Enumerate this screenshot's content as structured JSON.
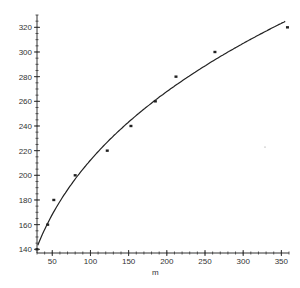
{
  "chart_data": {
    "type": "scatter",
    "title": "",
    "xlabel": "m",
    "ylabel": "",
    "xlim": [
      30,
      360
    ],
    "ylim": [
      137,
      330
    ],
    "x_ticks": [
      50,
      100,
      150,
      200,
      250,
      300,
      350
    ],
    "y_ticks": [
      140,
      160,
      180,
      200,
      220,
      240,
      260,
      280,
      300,
      320
    ],
    "grid": false,
    "legend": null,
    "series": [
      {
        "name": "data points",
        "type": "scatter",
        "x": [
          30,
          44,
          52,
          80,
          122,
          153,
          185,
          212,
          263,
          358
        ],
        "y": [
          140,
          160,
          180,
          200,
          220,
          240,
          260,
          280,
          300,
          320
        ]
      },
      {
        "name": "fitted curve",
        "type": "line",
        "x": [
          30,
          40,
          50,
          75,
          100,
          150,
          200,
          250,
          300,
          355
        ],
        "y": [
          143,
          156,
          168,
          192,
          211,
          242,
          267,
          289,
          308,
          327
        ]
      }
    ]
  }
}
